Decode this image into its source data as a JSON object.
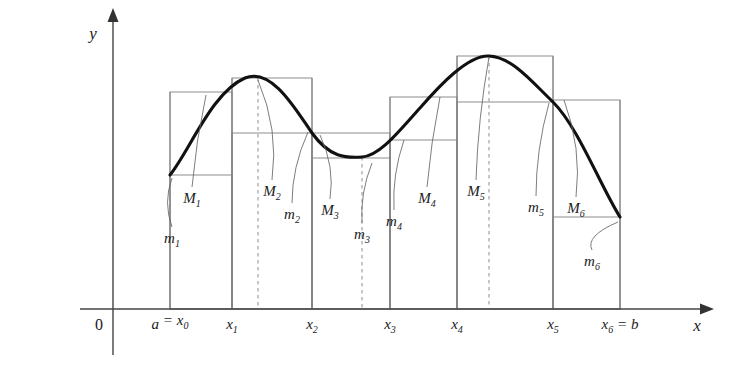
{
  "figure": {
    "background_color": "#ffffff",
    "curve_color": "#111111",
    "rect_color": "#808080",
    "axis_color": "#444444",
    "leader_color": "#666666",
    "dashed_color": "#999999"
  },
  "axes": {
    "y_label": "y",
    "x_label": "x",
    "origin_label": "0",
    "x_axis_y": 309,
    "y_axis_x": 113,
    "x_axis_end": 700,
    "y_axis_top": 22
  },
  "ticks": [
    {
      "name": "x0",
      "label_parts": [
        "a",
        "=",
        "x",
        "0"
      ],
      "label": "a = x₀",
      "x": 170
    },
    {
      "name": "x1",
      "label_parts": [
        "x",
        "1"
      ],
      "label": "x₁",
      "x": 232
    },
    {
      "name": "x2",
      "label_parts": [
        "x",
        "2"
      ],
      "label": "x₂",
      "x": 312
    },
    {
      "name": "x3",
      "label_parts": [
        "x",
        "3"
      ],
      "label": "x₃",
      "x": 390
    },
    {
      "name": "x4",
      "label_parts": [
        "x",
        "4"
      ],
      "label": "x₄",
      "x": 457
    },
    {
      "name": "x5",
      "label_parts": [
        "x",
        "5"
      ],
      "label": "x₅",
      "x": 553
    },
    {
      "name": "x6",
      "label_parts": [
        "x",
        "6",
        "=",
        "b"
      ],
      "label": "x₆ = b",
      "x": 620
    }
  ],
  "tick_label_y": 329,
  "sup_labels": [
    {
      "name": "M1",
      "base": "M",
      "sub": "1",
      "x": 192,
      "y": 203,
      "leader_to_x": 206,
      "leader_to_y": 95,
      "leader_ctrl_x": 196
    },
    {
      "name": "M2",
      "base": "M",
      "sub": "2",
      "x": 272,
      "y": 196,
      "leader_to_x": 258,
      "leader_to_y": 80,
      "leader_ctrl_x": 279
    },
    {
      "name": "M3",
      "base": "M",
      "sub": "3",
      "x": 330,
      "y": 215,
      "leader_to_x": 320,
      "leader_to_y": 135,
      "leader_ctrl_x": 335
    },
    {
      "name": "M4",
      "base": "M",
      "sub": "4",
      "x": 427,
      "y": 203,
      "leader_to_x": 440,
      "leader_to_y": 97,
      "leader_ctrl_x": 431
    },
    {
      "name": "M5",
      "base": "M",
      "sub": "5",
      "x": 476,
      "y": 196,
      "leader_to_x": 489,
      "leader_to_y": 57,
      "leader_ctrl_x": 478
    },
    {
      "name": "M6",
      "base": "M",
      "sub": "6",
      "x": 576,
      "y": 213,
      "leader_to_x": 564,
      "leader_to_y": 100,
      "leader_ctrl_x": 582
    }
  ],
  "inf_labels": [
    {
      "name": "m1",
      "base": "m",
      "sub": "1",
      "x": 172,
      "y": 243,
      "leader_to_x": 172,
      "leader_to_y": 178,
      "leader_ctrl_x": 163
    },
    {
      "name": "m2",
      "base": "m",
      "sub": "2",
      "x": 292,
      "y": 219,
      "leader_to_x": 308,
      "leader_to_y": 132,
      "leader_ctrl_x": 292
    },
    {
      "name": "m3",
      "base": "m",
      "sub": "3",
      "x": 362,
      "y": 239,
      "leader_to_x": 372,
      "leader_to_y": 163,
      "leader_ctrl_x": 360
    },
    {
      "name": "m4",
      "base": "m",
      "sub": "4",
      "x": 394,
      "y": 226,
      "leader_to_x": 404,
      "leader_to_y": 140,
      "leader_ctrl_x": 392
    },
    {
      "name": "m5",
      "base": "m",
      "sub": "5",
      "x": 536,
      "y": 212,
      "leader_to_x": 549,
      "leader_to_y": 103,
      "leader_ctrl_x": 536
    },
    {
      "name": "m6",
      "base": "m",
      "sub": "6",
      "x": 592,
      "y": 266,
      "leader_to_x": 618,
      "leader_to_y": 222,
      "leader_ctrl_x": 585
    }
  ],
  "chart_data": {
    "type": "line",
    "xlabel": "x",
    "ylabel": "y",
    "grid": false,
    "legend": "none",
    "axis_origin": [
      113,
      309
    ],
    "partition_x": [
      170,
      232,
      312,
      390,
      457,
      553,
      620
    ],
    "partition_labels": [
      "a = x₀",
      "x₁",
      "x₂",
      "x₃",
      "x₄",
      "x₅",
      "x₆ = b"
    ],
    "curve_path": "M 170 175 C 190 150 212 92 245 78 C 272 67 296 110 312 133 C 330 158 346 158 362 157 C 380 156 400 130 420 108 C 440 85 468 55 489 56 C 512 57 532 82 553 102 C 578 127 600 185 620 217",
    "curve_points": [
      [
        170,
        175
      ],
      [
        190,
        143
      ],
      [
        210,
        113
      ],
      [
        232,
        92
      ],
      [
        245,
        80
      ],
      [
        258,
        78
      ],
      [
        275,
        88
      ],
      [
        290,
        108
      ],
      [
        312,
        133
      ],
      [
        330,
        150
      ],
      [
        348,
        157
      ],
      [
        362,
        157
      ],
      [
        378,
        152
      ],
      [
        390,
        140
      ],
      [
        410,
        120
      ],
      [
        430,
        98
      ],
      [
        457,
        72
      ],
      [
        472,
        60
      ],
      [
        489,
        56
      ],
      [
        505,
        62
      ],
      [
        525,
        78
      ],
      [
        553,
        102
      ],
      [
        575,
        130
      ],
      [
        598,
        175
      ],
      [
        620,
        217
      ]
    ],
    "curve_max_points": [
      [
        258,
        78
      ],
      [
        489,
        56
      ]
    ],
    "curve_min_points": [
      [
        362,
        157
      ]
    ],
    "upper_rects": [
      {
        "index": 1,
        "x0": 170,
        "x1": 232,
        "top_y": 92
      },
      {
        "index": 2,
        "x0": 232,
        "x1": 312,
        "top_y": 78
      },
      {
        "index": 3,
        "x0": 312,
        "x1": 390,
        "top_y": 133
      },
      {
        "index": 4,
        "x0": 390,
        "x1": 457,
        "top_y": 97
      },
      {
        "index": 5,
        "x0": 457,
        "x1": 553,
        "top_y": 56
      },
      {
        "index": 6,
        "x0": 553,
        "x1": 620,
        "top_y": 100
      }
    ],
    "lower_rects": [
      {
        "index": 1,
        "x0": 170,
        "x1": 232,
        "top_y": 175
      },
      {
        "index": 2,
        "x0": 232,
        "x1": 312,
        "top_y": 133
      },
      {
        "index": 3,
        "x0": 312,
        "x1": 390,
        "top_y": 158
      },
      {
        "index": 4,
        "x0": 390,
        "x1": 457,
        "top_y": 140
      },
      {
        "index": 5,
        "x0": 457,
        "x1": 553,
        "top_y": 102
      },
      {
        "index": 6,
        "x0": 553,
        "x1": 620,
        "top_y": 217
      }
    ],
    "dashed_verticals": [
      {
        "name": "max1",
        "x": 258,
        "top_y": 78
      },
      {
        "name": "min1",
        "x": 362,
        "top_y": 157
      },
      {
        "name": "max2",
        "x": 489,
        "top_y": 56
      }
    ]
  }
}
